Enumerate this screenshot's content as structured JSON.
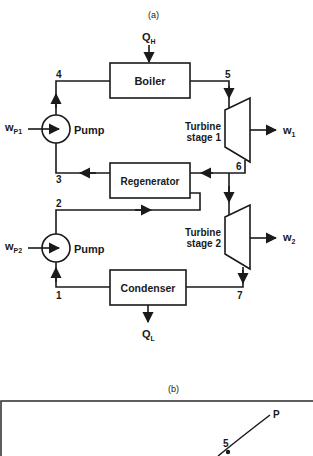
{
  "panel_a": {
    "caption": "(a)",
    "heat_in": {
      "main": "Q",
      "sub": "H"
    },
    "heat_out": {
      "main": "Q",
      "sub": "L"
    },
    "components": {
      "boiler": "Boiler",
      "regenerator": "Regenerator",
      "condenser": "Condenser",
      "pump1": "Pump",
      "pump2": "Pump",
      "turbine1_line1": "Turbine",
      "turbine1_line2": "stage 1",
      "turbine2_line1": "Turbine",
      "turbine2_line2": "stage 2"
    },
    "work": {
      "wp1": {
        "main": "w",
        "sub": "P1"
      },
      "wp2": {
        "main": "w",
        "sub": "P2"
      },
      "w1": {
        "main": "w",
        "sub": "1"
      },
      "w2": {
        "main": "w",
        "sub": "2"
      }
    },
    "states": [
      "1",
      "2",
      "3",
      "4",
      "5",
      "6",
      "7"
    ]
  },
  "panel_b": {
    "caption": "(b)",
    "curve_label": "P",
    "point_label": "5"
  }
}
